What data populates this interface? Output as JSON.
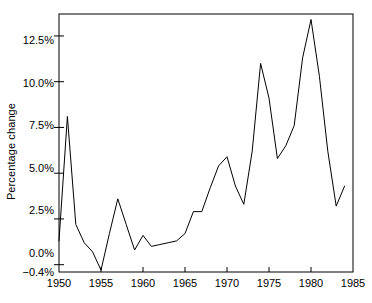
{
  "chart_data": {
    "type": "line",
    "title": "",
    "xlabel": "",
    "ylabel": "Percentage change",
    "xlim": [
      1950,
      1985
    ],
    "ylim": [
      -0.4,
      13.7
    ],
    "grid": false,
    "legend": "none",
    "x_ticks": [
      1950,
      1955,
      1960,
      1965,
      1970,
      1975,
      1980,
      1985
    ],
    "x_tick_labels": [
      "1950",
      "1955",
      "1960",
      "1965",
      "1970",
      "1975",
      "1980",
      "1985"
    ],
    "y_ticks": [
      -0.4,
      0.0,
      2.5,
      5.0,
      7.5,
      10.0,
      12.5
    ],
    "y_tick_labels": [
      "−0.4%",
      "0.0%",
      "2.5%",
      "5.0%",
      "7.5%",
      "10.0%",
      "12.5%"
    ],
    "line_color": "#000000",
    "x": [
      1950,
      1951,
      1952,
      1953,
      1954,
      1955,
      1956,
      1957,
      1958,
      1959,
      1960,
      1961,
      1962,
      1963,
      1964,
      1965,
      1966,
      1967,
      1968,
      1969,
      1970,
      1971,
      1972,
      1973,
      1974,
      1975,
      1976,
      1977,
      1978,
      1979,
      1980,
      1981,
      1982,
      1983,
      1984
    ],
    "values": [
      1.3,
      8.1,
      2.2,
      1.2,
      0.7,
      -0.3,
      1.7,
      3.6,
      2.2,
      0.8,
      1.6,
      1.0,
      1.1,
      1.2,
      1.3,
      1.7,
      2.9,
      2.9,
      4.2,
      5.4,
      5.9,
      4.3,
      3.3,
      6.2,
      11.0,
      9.1,
      5.8,
      6.5,
      7.6,
      11.3,
      13.4,
      10.3,
      6.2,
      3.2,
      4.3
    ],
    "series": [
      {
        "name": "Percentage change",
        "values": [
          1.3,
          8.1,
          2.2,
          1.2,
          0.7,
          -0.3,
          1.7,
          3.6,
          2.2,
          0.8,
          1.6,
          1.0,
          1.1,
          1.2,
          1.3,
          1.7,
          2.9,
          2.9,
          4.2,
          5.4,
          5.9,
          4.3,
          3.3,
          6.2,
          11.0,
          9.1,
          5.8,
          6.5,
          7.6,
          11.3,
          13.4,
          10.3,
          6.2,
          3.2,
          4.3
        ]
      }
    ]
  },
  "axes": {
    "y_title": "Percentage change"
  }
}
